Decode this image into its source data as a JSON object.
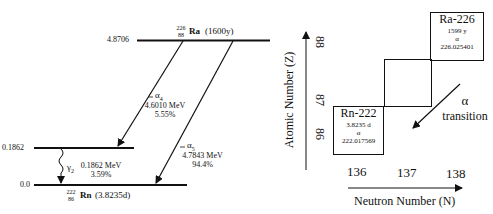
{
  "level_diagram": {
    "levels": [
      {
        "energy_label": "4.8706",
        "nuclide": {
          "mass": "226",
          "atomic": "88",
          "symbol": "Ra",
          "halflife": "(1600y)"
        }
      },
      {
        "energy_label": "0.1862"
      },
      {
        "energy_label": "0.0",
        "nuclide": {
          "mass": "222",
          "atomic": "86",
          "symbol": "Rn",
          "halflife": "(3.8235d)"
        }
      }
    ],
    "transitions": [
      {
        "name": "α",
        "sub": "4",
        "energy": "4.6010 MeV",
        "branch": "5.55%"
      },
      {
        "name": "α",
        "sub": "5",
        "energy": "4.7843 MeV",
        "branch": "94.4%"
      },
      {
        "name": "γ",
        "sub": "2",
        "energy": "0.1862 MeV",
        "branch": "3.59%"
      }
    ]
  },
  "chart_of_nuclides": {
    "y_axis_label": "Atomic Number (Z)",
    "x_axis_label": "Neutron Number (N)",
    "y_ticks": [
      "88",
      "87",
      "86"
    ],
    "x_ticks": [
      "136",
      "137",
      "138"
    ],
    "ra_box": {
      "name": "Ra-226",
      "halflife": "1599 y",
      "mode": "α",
      "mass": "226.025401"
    },
    "rn_box": {
      "name": "Rn-222",
      "halflife": "3.8235 d",
      "mode": "α",
      "mass": "222.017569"
    },
    "transition_label": {
      "line1": "α",
      "line2": "transition"
    }
  }
}
